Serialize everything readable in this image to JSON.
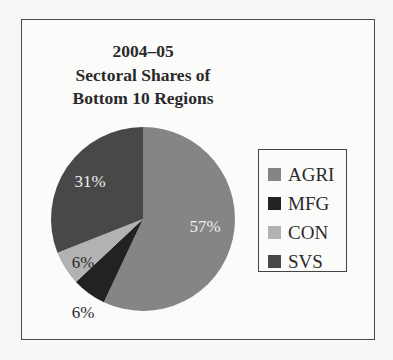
{
  "chart_data": {
    "type": "pie",
    "title": "2004–05 Sectoral Shares of Bottom 10 Regions",
    "title_lines": [
      "2004–05",
      "Sectoral Shares of",
      "Bottom 10 Regions"
    ],
    "categories": [
      "AGRI",
      "MFG",
      "CON",
      "SVS"
    ],
    "values": [
      57,
      6,
      6,
      31
    ],
    "labels": [
      "57%",
      "6%",
      "6%",
      "31%"
    ],
    "colors": [
      "#858585",
      "#222222",
      "#b2b2b2",
      "#484848"
    ],
    "label_colors": [
      "#eeeeee",
      "#2a2a2a",
      "#2a2a2a",
      "#eeeeee"
    ],
    "start_angle_deg": 0,
    "direction": "clockwise",
    "legend_position": "right"
  },
  "legend": {
    "items": [
      {
        "label": "AGRI",
        "color": "#858585"
      },
      {
        "label": "MFG",
        "color": "#222222"
      },
      {
        "label": "CON",
        "color": "#b2b2b2"
      },
      {
        "label": "SVS",
        "color": "#484848"
      }
    ]
  }
}
